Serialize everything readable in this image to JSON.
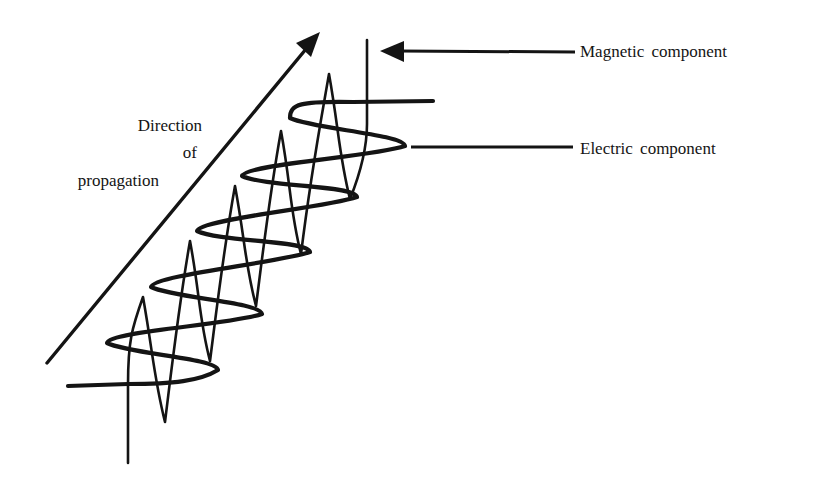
{
  "diagram": {
    "ink_color": "#141414",
    "background": "#ffffff"
  },
  "labels": {
    "magnetic": "Magnetic component",
    "electric": "Electric component",
    "propagation": [
      "Direction",
      "of",
      "propagation"
    ]
  },
  "propagation_arrow": {
    "start": [
      47,
      363
    ],
    "end": [
      306,
      49
    ],
    "head": [
      [
        320,
        32
      ],
      [
        296,
        43
      ],
      [
        311,
        57
      ]
    ]
  },
  "magnetic_leader": {
    "line_start": [
      575,
      52
    ],
    "line_end": [
      400,
      51
    ],
    "head": [
      [
        380,
        51
      ],
      [
        404,
        41
      ],
      [
        404,
        62
      ]
    ]
  },
  "electric_leader": {
    "start": [
      411,
      147
    ],
    "end": [
      573,
      147
    ]
  },
  "electric_wave": {
    "stroke_width": 4.2,
    "lead_in": [
      [
        68,
        386
      ],
      [
        128,
        384
      ]
    ],
    "right_extremes": [
      [
        218,
        370
      ],
      [
        262,
        314
      ],
      [
        310,
        252
      ],
      [
        357,
        197
      ],
      [
        405,
        146
      ]
    ],
    "left_extremes": [
      [
        107,
        343
      ],
      [
        151,
        287
      ],
      [
        197,
        231
      ],
      [
        242,
        176
      ],
      [
        290,
        118
      ]
    ],
    "lead_out": [
      [
        433,
        101
      ]
    ]
  },
  "magnetic_wave": {
    "stroke_width": 2.6,
    "lead_in": [
      [
        128,
        463
      ],
      [
        128,
        385
      ]
    ],
    "tops": [
      [
        143,
        297
      ],
      [
        190,
        241
      ],
      [
        235,
        186
      ],
      [
        281,
        131
      ],
      [
        329,
        74
      ]
    ],
    "bottoms": [
      [
        165,
        422
      ],
      [
        210,
        361
      ],
      [
        256,
        306
      ],
      [
        301,
        254
      ],
      [
        350,
        199
      ]
    ],
    "lead_out": [
      [
        367,
        40
      ]
    ]
  }
}
